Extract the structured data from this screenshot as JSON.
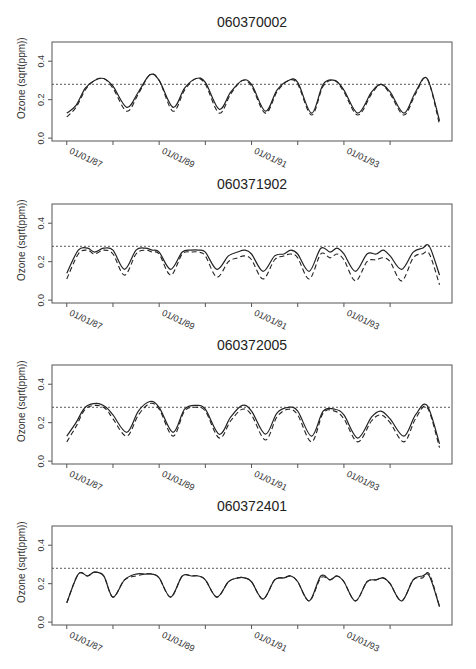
{
  "chart_data": [
    {
      "type": "line",
      "title": "060370002",
      "xlabel": "",
      "ylabel": "Ozone (sqrt(ppm))",
      "ylim": [
        -0.015,
        0.5
      ],
      "yticks": [
        "0.0",
        "0.2",
        "0.4"
      ],
      "ytick_values": [
        0.0,
        0.2,
        0.4
      ],
      "xticks": [
        "01/01/87",
        "01/01/89",
        "01/01/91",
        "01/01/93"
      ],
      "xtick_years": [
        87,
        88,
        89,
        90,
        91,
        92,
        93,
        94
      ],
      "xlim": [
        86.68,
        95.34
      ],
      "reference_line": 0.28,
      "grid": false,
      "series": [
        {
          "name": "solid",
          "style": "solid",
          "x": [
            87.0,
            87.2,
            87.4,
            87.6,
            87.8,
            88.0,
            88.3,
            88.55,
            88.8,
            89.0,
            89.3,
            89.55,
            89.8,
            90.0,
            90.3,
            90.55,
            90.8,
            91.0,
            91.3,
            91.55,
            91.8,
            92.0,
            92.3,
            92.55,
            92.8,
            93.0,
            93.3,
            93.6,
            93.8,
            94.0,
            94.3,
            94.55,
            94.8,
            95.07
          ],
          "values": [
            0.13,
            0.17,
            0.26,
            0.3,
            0.31,
            0.27,
            0.16,
            0.24,
            0.33,
            0.3,
            0.16,
            0.26,
            0.31,
            0.29,
            0.15,
            0.24,
            0.3,
            0.28,
            0.14,
            0.25,
            0.3,
            0.29,
            0.13,
            0.28,
            0.3,
            0.25,
            0.13,
            0.24,
            0.28,
            0.24,
            0.13,
            0.24,
            0.31,
            0.09
          ]
        },
        {
          "name": "dashed",
          "style": "dashed",
          "x": [
            87.0,
            87.2,
            87.4,
            87.6,
            87.8,
            88.0,
            88.3,
            88.55,
            88.8,
            89.0,
            89.3,
            89.55,
            89.8,
            90.0,
            90.3,
            90.55,
            90.8,
            91.0,
            91.3,
            91.55,
            91.8,
            92.0,
            92.3,
            92.55,
            92.8,
            93.0,
            93.3,
            93.6,
            93.8,
            94.0,
            94.3,
            94.55,
            94.8,
            95.07
          ],
          "values": [
            0.11,
            0.16,
            0.25,
            0.3,
            0.31,
            0.26,
            0.14,
            0.23,
            0.33,
            0.3,
            0.14,
            0.25,
            0.31,
            0.28,
            0.13,
            0.23,
            0.3,
            0.27,
            0.13,
            0.24,
            0.3,
            0.28,
            0.12,
            0.27,
            0.3,
            0.24,
            0.12,
            0.23,
            0.28,
            0.23,
            0.12,
            0.23,
            0.31,
            0.07
          ]
        }
      ]
    },
    {
      "type": "line",
      "title": "060371902",
      "xlabel": "",
      "ylabel": "Ozone (sqrt(ppm))",
      "ylim": [
        -0.015,
        0.5
      ],
      "yticks": [
        "0.0",
        "0.2",
        "0.4"
      ],
      "ytick_values": [
        0.0,
        0.2,
        0.4
      ],
      "xticks": [
        "01/01/87",
        "01/01/89",
        "01/01/91",
        "01/01/93"
      ],
      "xtick_years": [
        87,
        88,
        89,
        90,
        91,
        92,
        93,
        94
      ],
      "xlim": [
        86.68,
        95.34
      ],
      "reference_line": 0.28,
      "grid": false,
      "series": [
        {
          "name": "solid",
          "style": "solid",
          "x": [
            87.0,
            87.25,
            87.45,
            87.6,
            87.8,
            88.0,
            88.25,
            88.5,
            88.7,
            88.85,
            89.0,
            89.25,
            89.5,
            89.7,
            89.85,
            90.0,
            90.25,
            90.5,
            90.7,
            90.85,
            91.0,
            91.25,
            91.5,
            91.7,
            91.85,
            92.0,
            92.25,
            92.5,
            92.7,
            92.85,
            93.0,
            93.25,
            93.5,
            93.7,
            93.85,
            94.0,
            94.25,
            94.5,
            94.7,
            94.85,
            95.07
          ],
          "values": [
            0.14,
            0.26,
            0.27,
            0.25,
            0.27,
            0.26,
            0.16,
            0.26,
            0.27,
            0.26,
            0.25,
            0.16,
            0.25,
            0.26,
            0.26,
            0.25,
            0.16,
            0.23,
            0.25,
            0.26,
            0.24,
            0.15,
            0.23,
            0.24,
            0.26,
            0.24,
            0.15,
            0.27,
            0.25,
            0.27,
            0.24,
            0.15,
            0.24,
            0.24,
            0.26,
            0.23,
            0.16,
            0.25,
            0.27,
            0.28,
            0.13
          ]
        },
        {
          "name": "dashed",
          "style": "dashed",
          "x": [
            87.0,
            87.25,
            87.45,
            87.6,
            87.8,
            88.0,
            88.25,
            88.5,
            88.7,
            88.85,
            89.0,
            89.25,
            89.5,
            89.7,
            89.85,
            90.0,
            90.25,
            90.5,
            90.7,
            90.85,
            91.0,
            91.25,
            91.5,
            91.7,
            91.85,
            92.0,
            92.25,
            92.5,
            92.7,
            92.85,
            93.0,
            93.25,
            93.5,
            93.7,
            93.85,
            94.0,
            94.25,
            94.5,
            94.7,
            94.85,
            95.07
          ],
          "values": [
            0.11,
            0.24,
            0.26,
            0.24,
            0.26,
            0.24,
            0.13,
            0.24,
            0.26,
            0.25,
            0.24,
            0.13,
            0.24,
            0.25,
            0.25,
            0.23,
            0.12,
            0.2,
            0.22,
            0.23,
            0.21,
            0.11,
            0.21,
            0.23,
            0.24,
            0.22,
            0.11,
            0.24,
            0.22,
            0.24,
            0.21,
            0.1,
            0.2,
            0.21,
            0.22,
            0.2,
            0.1,
            0.22,
            0.24,
            0.24,
            0.08
          ]
        }
      ]
    },
    {
      "type": "line",
      "title": "060372005",
      "xlabel": "",
      "ylabel": "Ozone (sqrt(ppm))",
      "ylim": [
        -0.015,
        0.5
      ],
      "yticks": [
        "0.0",
        "0.2",
        "0.4"
      ],
      "ytick_values": [
        0.0,
        0.2,
        0.4
      ],
      "xticks": [
        "01/01/87",
        "01/01/89",
        "01/01/91",
        "01/01/93"
      ],
      "xtick_years": [
        87,
        88,
        89,
        90,
        91,
        92,
        93,
        94
      ],
      "xlim": [
        86.68,
        95.34
      ],
      "reference_line": 0.28,
      "grid": false,
      "series": [
        {
          "name": "solid",
          "style": "solid",
          "x": [
            87.0,
            87.2,
            87.4,
            87.65,
            87.85,
            88.0,
            88.3,
            88.55,
            88.8,
            89.0,
            89.3,
            89.55,
            89.8,
            90.0,
            90.3,
            90.55,
            90.8,
            91.0,
            91.3,
            91.55,
            91.8,
            92.0,
            92.3,
            92.55,
            92.8,
            93.0,
            93.3,
            93.6,
            93.8,
            94.0,
            94.3,
            94.55,
            94.8,
            95.07
          ],
          "values": [
            0.13,
            0.2,
            0.28,
            0.3,
            0.28,
            0.24,
            0.15,
            0.26,
            0.31,
            0.28,
            0.15,
            0.27,
            0.29,
            0.27,
            0.14,
            0.23,
            0.29,
            0.26,
            0.14,
            0.25,
            0.28,
            0.26,
            0.13,
            0.26,
            0.27,
            0.24,
            0.12,
            0.23,
            0.26,
            0.22,
            0.13,
            0.24,
            0.29,
            0.09
          ]
        },
        {
          "name": "dashed",
          "style": "dashed",
          "x": [
            87.0,
            87.2,
            87.4,
            87.65,
            87.85,
            88.0,
            88.3,
            88.55,
            88.8,
            89.0,
            89.3,
            89.55,
            89.8,
            90.0,
            90.3,
            90.55,
            90.8,
            91.0,
            91.3,
            91.55,
            91.8,
            92.0,
            92.3,
            92.55,
            92.8,
            93.0,
            93.3,
            93.6,
            93.8,
            94.0,
            94.3,
            94.55,
            94.8,
            95.07
          ],
          "values": [
            0.1,
            0.18,
            0.27,
            0.29,
            0.27,
            0.22,
            0.13,
            0.24,
            0.3,
            0.27,
            0.13,
            0.26,
            0.28,
            0.26,
            0.12,
            0.21,
            0.27,
            0.24,
            0.11,
            0.23,
            0.27,
            0.24,
            0.1,
            0.25,
            0.26,
            0.22,
            0.1,
            0.21,
            0.24,
            0.2,
            0.1,
            0.22,
            0.28,
            0.07
          ]
        }
      ]
    },
    {
      "type": "line",
      "title": "060372401",
      "xlabel": "",
      "ylabel": "Ozone (sqrt(ppm))",
      "ylim": [
        -0.015,
        0.5
      ],
      "yticks": [
        "0.0",
        "0.2",
        "0.4"
      ],
      "ytick_values": [
        0.0,
        0.2,
        0.4
      ],
      "xticks": [
        "01/01/87",
        "01/01/89",
        "01/01/91",
        "01/01/93"
      ],
      "xtick_years": [
        87,
        88,
        89,
        90,
        91,
        92,
        93,
        94
      ],
      "xlim": [
        86.68,
        95.34
      ],
      "reference_line": 0.28,
      "grid": false,
      "series": [
        {
          "name": "solid",
          "style": "solid",
          "x": [
            87.0,
            87.25,
            87.45,
            87.6,
            87.8,
            88.0,
            88.25,
            88.5,
            88.7,
            88.85,
            89.0,
            89.25,
            89.5,
            89.7,
            89.85,
            90.0,
            90.25,
            90.5,
            90.7,
            90.85,
            91.0,
            91.25,
            91.5,
            91.7,
            91.85,
            92.0,
            92.25,
            92.5,
            92.7,
            92.85,
            93.0,
            93.25,
            93.5,
            93.7,
            93.85,
            94.0,
            94.25,
            94.5,
            94.7,
            94.85,
            95.07
          ],
          "values": [
            0.1,
            0.25,
            0.24,
            0.26,
            0.24,
            0.13,
            0.22,
            0.25,
            0.25,
            0.25,
            0.23,
            0.13,
            0.24,
            0.24,
            0.24,
            0.22,
            0.13,
            0.21,
            0.23,
            0.23,
            0.21,
            0.12,
            0.22,
            0.23,
            0.24,
            0.21,
            0.11,
            0.24,
            0.22,
            0.24,
            0.21,
            0.11,
            0.21,
            0.22,
            0.23,
            0.2,
            0.11,
            0.22,
            0.24,
            0.24,
            0.08
          ]
        },
        {
          "name": "dashed",
          "style": "dashed",
          "x": [
            87.0,
            87.25,
            87.45,
            87.6,
            87.8,
            88.0,
            88.25,
            88.5,
            88.7,
            88.85,
            89.0,
            89.25,
            89.5,
            89.7,
            89.85,
            90.0,
            90.25,
            90.5,
            90.7,
            90.85,
            91.0,
            91.25,
            91.5,
            91.7,
            91.85,
            92.0,
            92.25,
            92.5,
            92.7,
            92.85,
            93.0,
            93.25,
            93.5,
            93.7,
            93.85,
            94.0,
            94.25,
            94.5,
            94.7,
            94.85,
            95.07
          ],
          "values": [
            0.1,
            0.25,
            0.24,
            0.26,
            0.24,
            0.13,
            0.22,
            0.24,
            0.25,
            0.25,
            0.23,
            0.13,
            0.24,
            0.24,
            0.24,
            0.22,
            0.13,
            0.21,
            0.23,
            0.23,
            0.21,
            0.12,
            0.22,
            0.23,
            0.24,
            0.21,
            0.11,
            0.23,
            0.22,
            0.24,
            0.21,
            0.11,
            0.21,
            0.22,
            0.23,
            0.2,
            0.11,
            0.22,
            0.23,
            0.25,
            0.08
          ]
        }
      ]
    }
  ],
  "panels": [
    {
      "title": "060370002",
      "ylabel": "Ozone (sqrt(ppm))"
    },
    {
      "title": "060371902",
      "ylabel": "Ozone (sqrt(ppm))"
    },
    {
      "title": "060372005",
      "ylabel": "Ozone (sqrt(ppm))"
    },
    {
      "title": "060372401",
      "ylabel": "Ozone (sqrt(ppm))"
    }
  ]
}
